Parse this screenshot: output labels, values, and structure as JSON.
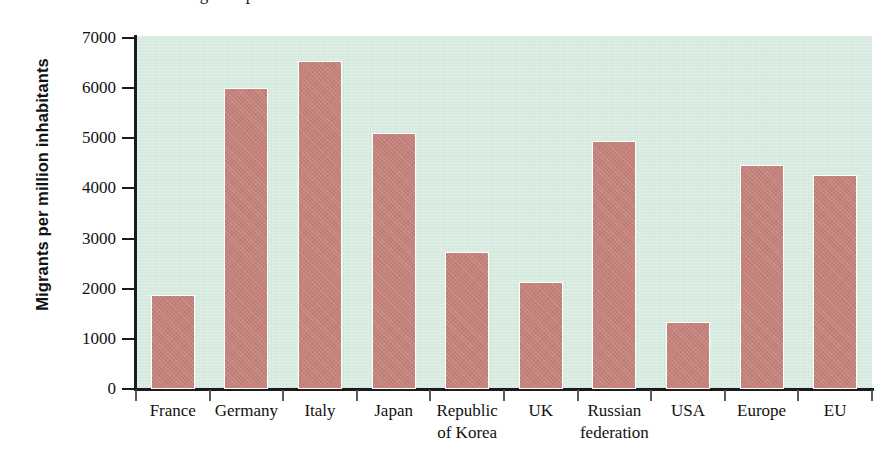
{
  "figure": {
    "top_caption_partial": "Migrants per million inhabitants in selected countries",
    "background_color": "#d9ece1",
    "bar_color": "#c4817a",
    "axis_color": "#1b1b1b"
  },
  "chart_data": {
    "type": "bar",
    "title": "",
    "xlabel": "",
    "ylabel": "Migrants per million inhabitants",
    "ylim": [
      0,
      7000
    ],
    "ytick_values": [
      0,
      1000,
      2000,
      3000,
      4000,
      5000,
      6000,
      7000
    ],
    "ytick_labels": [
      "0",
      "1000",
      "2000",
      "3000",
      "4000",
      "5000",
      "6000",
      "7000"
    ],
    "grid": false,
    "legend": null,
    "categories": [
      "France",
      "Germany",
      "Italy",
      "Japan",
      "Republic\nof Korea",
      "UK",
      "Russian\nfederation",
      "USA",
      "Europe",
      "EU"
    ],
    "category_lines": [
      [
        "France"
      ],
      [
        "Germany"
      ],
      [
        "Italy"
      ],
      [
        "Japan"
      ],
      [
        "Republic",
        "of Korea"
      ],
      [
        "UK"
      ],
      [
        "Russian",
        "federation"
      ],
      [
        "USA"
      ],
      [
        "Europe"
      ],
      [
        "EU"
      ]
    ],
    "values": [
      1870,
      6000,
      6550,
      5100,
      2730,
      2130,
      4950,
      1340,
      4460,
      4260
    ],
    "series": [
      {
        "name": "Migrants per million inhabitants",
        "values": [
          1870,
          6000,
          6550,
          5100,
          2730,
          2130,
          4950,
          1340,
          4460,
          4260
        ]
      }
    ]
  }
}
